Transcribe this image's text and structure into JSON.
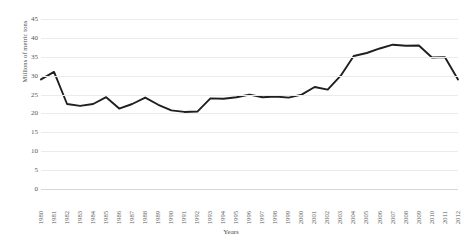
{
  "chart_data": {
    "type": "line",
    "title": "",
    "xlabel": "Years",
    "ylabel": "Millions of metric tons",
    "categories": [
      "1980",
      "1981",
      "1982",
      "1983",
      "1984",
      "1985",
      "1986",
      "1987",
      "1988",
      "1989",
      "1990",
      "1991",
      "1992",
      "1993",
      "1994",
      "1995",
      "1996",
      "1997",
      "1998",
      "1999",
      "2000",
      "2001",
      "2002",
      "2003",
      "2004",
      "2005",
      "2006",
      "2007",
      "2008",
      "2009",
      "2010",
      "2011",
      "2012"
    ],
    "values": [
      29.0,
      31.0,
      22.5,
      22.0,
      22.5,
      24.3,
      21.3,
      22.5,
      24.2,
      22.3,
      20.8,
      20.4,
      20.5,
      24.0,
      23.9,
      24.3,
      25.0,
      24.3,
      24.5,
      24.2,
      25.0,
      27.0,
      26.3,
      30.0,
      35.2,
      36.0,
      37.2,
      38.2,
      37.9,
      38.0,
      34.8,
      34.9,
      29.0
    ],
    "ylim": [
      0,
      45
    ],
    "yticks": [
      0,
      5,
      10,
      15,
      20,
      25,
      30,
      35,
      40,
      45
    ],
    "ytick_labels": [
      "0",
      "5",
      "10",
      "15",
      "20",
      "25",
      "30",
      "35",
      "40",
      "45"
    ],
    "grid": true,
    "legend": "none",
    "line_color": "#1f1f1f",
    "grid_color": "#eceaea",
    "series": [
      {
        "name": "series-1",
        "values": [
          29.0,
          31.0,
          22.5,
          22.0,
          22.5,
          24.3,
          21.3,
          22.5,
          24.2,
          22.3,
          20.8,
          20.4,
          20.5,
          24.0,
          23.9,
          24.3,
          25.0,
          24.3,
          24.5,
          24.2,
          25.0,
          27.0,
          26.3,
          30.0,
          35.2,
          36.0,
          37.2,
          38.2,
          37.9,
          38.0,
          34.8,
          34.9,
          29.0
        ]
      }
    ]
  }
}
